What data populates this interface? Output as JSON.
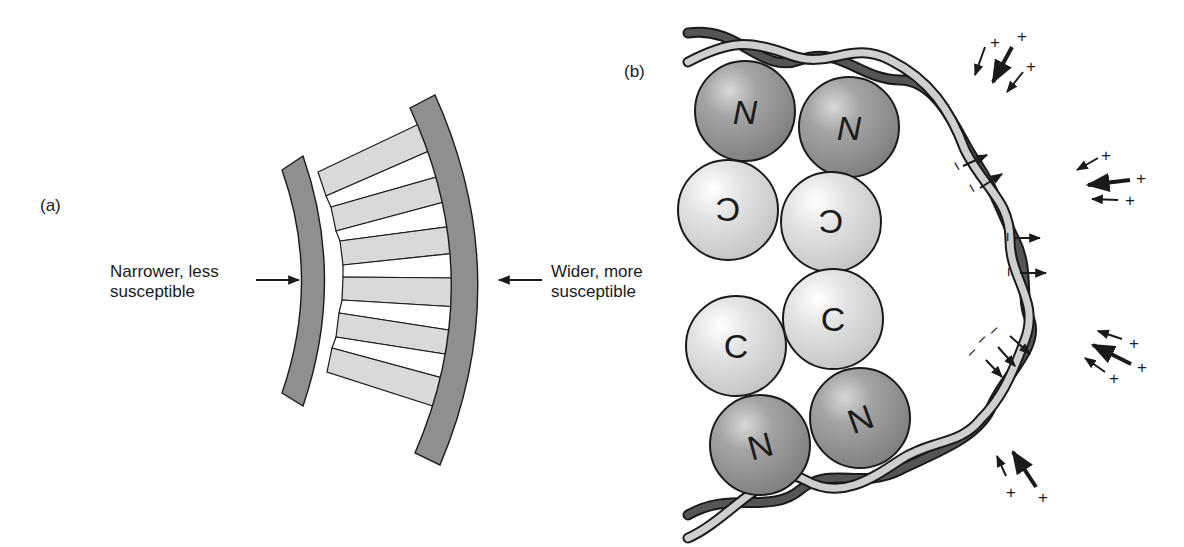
{
  "panel_a": {
    "tag": "(a)",
    "left_label": {
      "line1": "Narrower, less",
      "line2": "susceptible"
    },
    "right_label": {
      "line1": "Wider, more",
      "line2": "susceptible"
    }
  },
  "panel_b": {
    "tag": "(b)",
    "spheres": [
      {
        "letter": "N",
        "kind": "dark"
      },
      {
        "letter": "N",
        "kind": "dark"
      },
      {
        "letter": "C",
        "kind": "light",
        "flipped": true
      },
      {
        "letter": "C",
        "kind": "light",
        "flipped": true
      },
      {
        "letter": "C",
        "kind": "light",
        "flipped": false
      },
      {
        "letter": "C",
        "kind": "light",
        "flipped": false
      },
      {
        "letter": "N",
        "kind": "dark"
      },
      {
        "letter": "N",
        "kind": "dark"
      }
    ],
    "charge_signs": {
      "positive": "+",
      "negative": "−"
    }
  },
  "colors": {
    "dark_gray": "#8f8f8f",
    "light_gray": "#d6d6d6",
    "outline": "#1a1a1a",
    "ribbon_dark": "#4a4a4a",
    "ribbon_light": "#c8c8c8"
  }
}
